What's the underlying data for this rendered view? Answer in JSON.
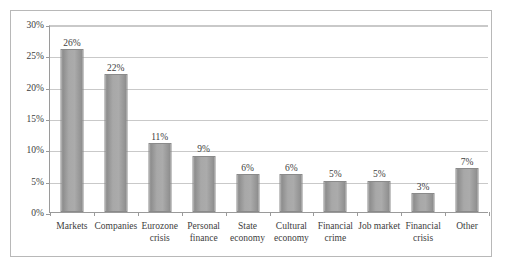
{
  "chart_data": {
    "type": "bar",
    "title": "",
    "xlabel": "",
    "ylabel": "",
    "ylim": [
      0,
      30
    ],
    "ytick_labels": [
      "0%",
      "5%",
      "10%",
      "15%",
      "20%",
      "25%",
      "30%"
    ],
    "ytick_values": [
      0,
      5,
      10,
      15,
      20,
      25,
      30
    ],
    "grid": true,
    "legend": "none",
    "value_suffix": "%",
    "bar_color": "#a3a3a3",
    "bar_border_color": "#8a8a8a",
    "gridline_color": "#c9c9c9",
    "axis_color": "#9a9a9a",
    "frame_color": "#b8b8b8",
    "text_color": "#3d3d3d",
    "categories": [
      "Markets",
      "Companies",
      "Eurozone crisis",
      "Personal finance",
      "State economy",
      "Cultural economy",
      "Financial crime",
      "Job market",
      "Financial crisis",
      "Other"
    ],
    "category_lines": [
      [
        "Markets"
      ],
      [
        "Companies"
      ],
      [
        "Eurozone",
        "crisis"
      ],
      [
        "Personal",
        "finance"
      ],
      [
        "State",
        "economy"
      ],
      [
        "Cultural",
        "economy"
      ],
      [
        "Financial",
        "crime"
      ],
      [
        "Job market"
      ],
      [
        "Financial",
        "crisis"
      ],
      [
        "Other"
      ]
    ],
    "values": [
      26,
      22,
      11,
      9,
      6,
      6,
      5,
      5,
      3,
      7
    ],
    "value_labels": [
      "26%",
      "22%",
      "11%",
      "9%",
      "6%",
      "6%",
      "5%",
      "5%",
      "3%",
      "7%"
    ]
  }
}
